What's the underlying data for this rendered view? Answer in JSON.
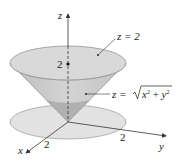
{
  "diagram": {
    "axes": {
      "x_label": "x",
      "y_label": "y",
      "z_label": "z",
      "x_tick": "2",
      "y_tick": "2",
      "z_tick": "2"
    },
    "labels": {
      "plane": "z = 2",
      "cone_prefix": "z = ",
      "cone_radicand_x": "x",
      "cone_radicand_plus": " + ",
      "cone_radicand_y": "y",
      "cone_exp": "2"
    },
    "colors": {
      "cone_side": "#c8c8c8",
      "cone_top": "#d9d9d9",
      "cone_inner": "#a9a9a9",
      "disk": "#e2e2e2",
      "outline": "#8a8a8a",
      "axis": "#333333"
    }
  }
}
